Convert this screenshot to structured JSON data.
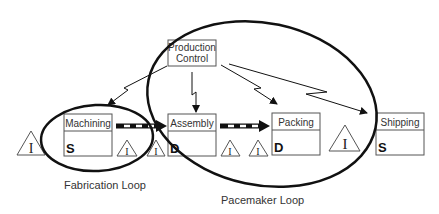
{
  "diagram": {
    "production_control": {
      "label_line1": "Production",
      "label_line2": "Control"
    },
    "processes": [
      {
        "name": "Machining",
        "code": "S"
      },
      {
        "name": "Assembly",
        "code": "D"
      },
      {
        "name": "Packing",
        "code": "D"
      },
      {
        "name": "Shipping",
        "code": "S"
      }
    ],
    "inventory_symbol": "I",
    "loops": [
      {
        "label": "Fabrication Loop"
      },
      {
        "label": "Pacemaker Loop"
      }
    ],
    "colors": {
      "line": "#111111",
      "box_border": "#555555",
      "text": "#333333",
      "background": "#ffffff"
    }
  }
}
